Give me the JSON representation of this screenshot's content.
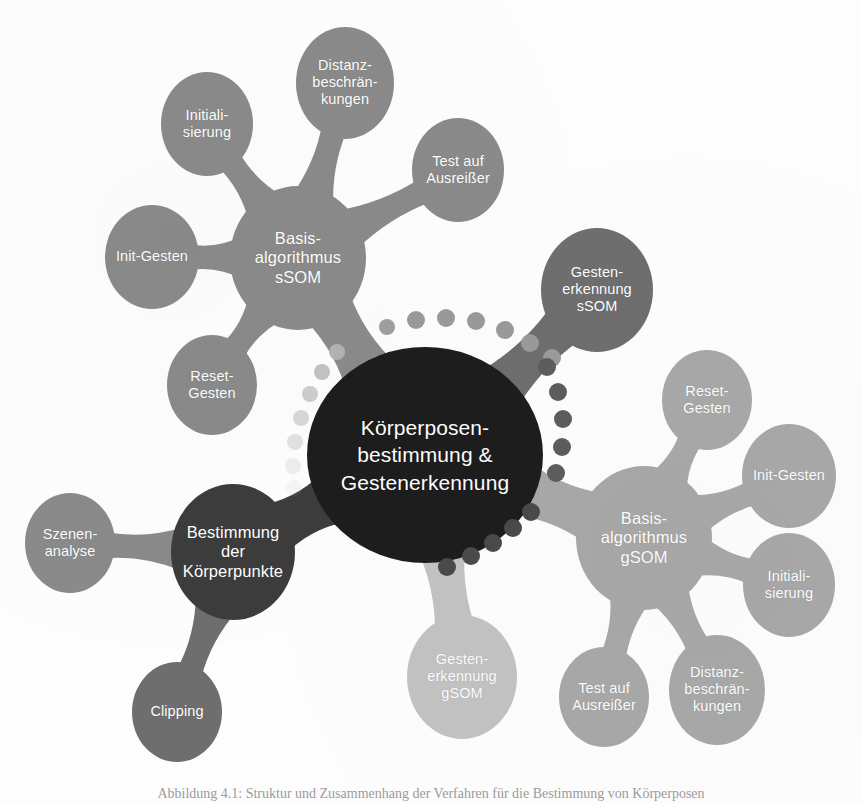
{
  "figure": {
    "caption": "Abbildung 4.1: Struktur und Zusammenhang der Verfahren für die Bestimmung von Körperposen",
    "background_color": "#ffffff"
  },
  "palette": {
    "center_dark": "#1d1d1d",
    "hub_body_points": "#3c3c3c",
    "hub_ssom": "#8a8a8a",
    "hub_gsom": "#a8a8a8",
    "gesten_ssom": "#6e6e6e",
    "gesten_gsom": "#c2c2c2",
    "leaf_mid": "#8a8a8a",
    "leaf_light": "#a8a8a8",
    "leaf_dark": "#6e6e6e",
    "text_on_node": "#ffffff"
  },
  "center": {
    "id": "koerperposen-center",
    "label": "Körperposen-\nbestimmung &\nGestenerkennung",
    "color": "#1d1d1d",
    "cx": 425,
    "cy": 455,
    "rx": 118,
    "ry": 108
  },
  "hubs": [
    {
      "id": "basis-algorithmus-ssom",
      "label": "Basis-\nalgorithmus\nsSOM",
      "color": "#8a8a8a",
      "cx": 298,
      "cy": 258,
      "rx": 68,
      "ry": 72
    },
    {
      "id": "basis-algorithmus-gsom",
      "label": "Basis-\nalgorithmus\ngSOM",
      "color": "#a8a8a8",
      "cx": 644,
      "cy": 538,
      "rx": 68,
      "ry": 72
    },
    {
      "id": "bestimmung-koerperpunkte",
      "label": "Bestimmung\nder\nKörperpunkte",
      "color": "#3c3c3c",
      "cx": 233,
      "cy": 552,
      "rx": 62,
      "ry": 68
    }
  ],
  "branch_nodes": [
    {
      "id": "gestenerkennung-ssom",
      "label": "Gesten-\nerkennung\nsSOM",
      "color": "#6e6e6e",
      "cx": 597,
      "cy": 290,
      "rx": 56,
      "ry": 62
    },
    {
      "id": "gestenerkennung-gsom",
      "label": "Gesten-\nerkennung\ngSOM",
      "color": "#c2c2c2",
      "cx": 462,
      "cy": 677,
      "rx": 55,
      "ry": 62
    }
  ],
  "leaves": [
    {
      "id": "ssom-initialisierung",
      "parent": "basis-algorithmus-ssom",
      "label": "Initiali-\nsierung",
      "color": "#8a8a8a",
      "cx": 207,
      "cy": 124,
      "rx": 46,
      "ry": 52
    },
    {
      "id": "ssom-distanz",
      "parent": "basis-algorithmus-ssom",
      "label": "Distanz-\nbeschrän-\nkungen",
      "color": "#8a8a8a",
      "cx": 345,
      "cy": 83,
      "rx": 49,
      "ry": 56
    },
    {
      "id": "ssom-test-ausreisser",
      "parent": "basis-algorithmus-ssom",
      "label": "Test auf\nAusreißer",
      "color": "#8a8a8a",
      "cx": 458,
      "cy": 170,
      "rx": 46,
      "ry": 52
    },
    {
      "id": "ssom-init-gesten",
      "parent": "basis-algorithmus-ssom",
      "label": "Init-Gesten",
      "color": "#8a8a8a",
      "cx": 152,
      "cy": 257,
      "rx": 47,
      "ry": 52
    },
    {
      "id": "ssom-reset-gesten",
      "parent": "basis-algorithmus-ssom",
      "label": "Reset-\nGesten",
      "color": "#8a8a8a",
      "cx": 212,
      "cy": 385,
      "rx": 45,
      "ry": 50
    },
    {
      "id": "gsom-reset-gesten",
      "parent": "basis-algorithmus-gsom",
      "label": "Reset-\nGesten",
      "color": "#a8a8a8",
      "cx": 707,
      "cy": 400,
      "rx": 45,
      "ry": 50
    },
    {
      "id": "gsom-init-gesten",
      "parent": "basis-algorithmus-gsom",
      "label": "Init-Gesten",
      "color": "#a8a8a8",
      "cx": 789,
      "cy": 476,
      "rx": 47,
      "ry": 52
    },
    {
      "id": "gsom-initialisierung",
      "parent": "basis-algorithmus-gsom",
      "label": "Initiali-\nsierung",
      "color": "#a8a8a8",
      "cx": 789,
      "cy": 585,
      "rx": 46,
      "ry": 52
    },
    {
      "id": "gsom-distanz",
      "parent": "basis-algorithmus-gsom",
      "label": "Distanz-\nbeschrän-\nkungen",
      "color": "#a8a8a8",
      "cx": 717,
      "cy": 690,
      "rx": 48,
      "ry": 55
    },
    {
      "id": "gsom-test-ausreisser",
      "parent": "basis-algorithmus-gsom",
      "label": "Test auf\nAusreißer",
      "color": "#a8a8a8",
      "cx": 604,
      "cy": 697,
      "rx": 45,
      "ry": 50
    },
    {
      "id": "szenenanalyse",
      "parent": "bestimmung-koerperpunkte",
      "label": "Szenen-\nanalyse",
      "color": "#8a8a8a",
      "cx": 70,
      "cy": 543,
      "rx": 45,
      "ry": 50
    },
    {
      "id": "clipping",
      "parent": "bestimmung-koerperpunkte",
      "label": "Clipping",
      "color": "#6e6e6e",
      "cx": 177,
      "cy": 712,
      "rx": 45,
      "ry": 50
    }
  ],
  "dot_trails": [
    {
      "id": "trail-center-to-gesten-ssom",
      "description": "dotted connector from central node arcing up-right to Gestenerkennung sSOM",
      "color": "#9a9a9a",
      "dots": [
        {
          "x": 387,
          "y": 327,
          "r": 8,
          "o": 0.95
        },
        {
          "x": 416,
          "y": 320,
          "r": 9,
          "o": 1.0
        },
        {
          "x": 446,
          "y": 318,
          "r": 9,
          "o": 1.0
        },
        {
          "x": 476,
          "y": 321,
          "r": 9,
          "o": 1.0
        },
        {
          "x": 505,
          "y": 330,
          "r": 9,
          "o": 1.0
        },
        {
          "x": 530,
          "y": 343,
          "r": 9,
          "o": 1.0
        },
        {
          "x": 552,
          "y": 358,
          "r": 9,
          "o": 1.0
        }
      ]
    },
    {
      "id": "trail-ssom-to-center",
      "description": "fading dotted connector from Basis-algorithmus sSOM down to the central node",
      "color": "#b4b4b4",
      "dots": [
        {
          "x": 337,
          "y": 352,
          "r": 8,
          "o": 0.95
        },
        {
          "x": 322,
          "y": 372,
          "r": 8,
          "o": 0.82
        },
        {
          "x": 310,
          "y": 394,
          "r": 8,
          "o": 0.68
        },
        {
          "x": 301,
          "y": 418,
          "r": 8,
          "o": 0.52
        },
        {
          "x": 295,
          "y": 442,
          "r": 8,
          "o": 0.38
        },
        {
          "x": 293,
          "y": 466,
          "r": 8,
          "o": 0.22
        },
        {
          "x": 294,
          "y": 488,
          "r": 8,
          "o": 0.1
        }
      ]
    },
    {
      "id": "trail-center-to-gsom",
      "description": "dark dotted connector from central node arcing down-right toward the gSOM cluster",
      "color": "#4a4a4a",
      "dots": [
        {
          "x": 531,
          "y": 512,
          "r": 9,
          "o": 1.0
        },
        {
          "x": 513,
          "y": 528,
          "r": 9,
          "o": 1.0
        },
        {
          "x": 493,
          "y": 543,
          "r": 9,
          "o": 1.0
        },
        {
          "x": 471,
          "y": 556,
          "r": 9,
          "o": 1.0
        },
        {
          "x": 447,
          "y": 567,
          "r": 9,
          "o": 1.0
        }
      ]
    },
    {
      "id": "trail-gesten-ssom-down",
      "description": "dotted connector descending from Gestenerkennung sSOM toward the gSOM hub",
      "color": "#5d5d5d",
      "dots": [
        {
          "x": 547,
          "y": 367,
          "r": 9,
          "o": 1.0
        },
        {
          "x": 558,
          "y": 392,
          "r": 9,
          "o": 1.0
        },
        {
          "x": 563,
          "y": 419,
          "r": 9,
          "o": 1.0
        },
        {
          "x": 562,
          "y": 447,
          "r": 9,
          "o": 1.0
        },
        {
          "x": 556,
          "y": 473,
          "r": 9,
          "o": 1.0
        }
      ]
    }
  ]
}
